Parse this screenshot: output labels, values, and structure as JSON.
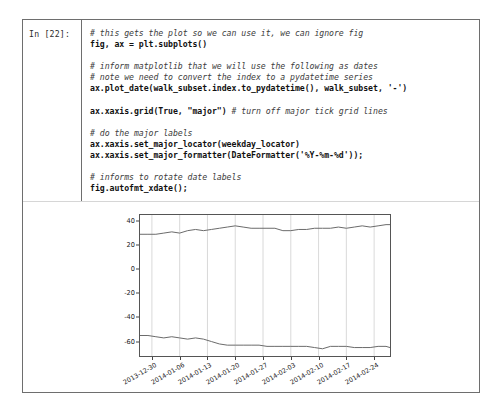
{
  "notebook": {
    "prompt_label": "In [22]:",
    "code_lines": [
      {
        "text": "# this gets the plot so we can use it, we can ignore fig",
        "style": "comment"
      },
      {
        "text": "fig, ax = plt.subplots()",
        "style": "code"
      },
      {
        "text": "",
        "style": "blank"
      },
      {
        "text": "# inform matplotlib that we will use the following as dates",
        "style": "comment"
      },
      {
        "text": "# note we need to convert the index to a pydatetime series",
        "style": "comment"
      },
      {
        "text": "ax.plot_date(walk_subset.index.to_pydatetime(), walk_subset, '-')",
        "style": "code"
      },
      {
        "text": "",
        "style": "blank"
      },
      {
        "text": "ax.xaxis.grid(True, \"major\") # turn off major tick grid lines",
        "style": "code-comment"
      },
      {
        "text": "",
        "style": "blank"
      },
      {
        "text": "# do the major labels",
        "style": "comment"
      },
      {
        "text": "ax.xaxis.set_major_locator(weekday_locator)",
        "style": "code"
      },
      {
        "text": "ax.xaxis.set_major_formatter(DateFormatter('%Y-%m-%d'));",
        "style": "code"
      },
      {
        "text": "",
        "style": "blank"
      },
      {
        "text": "# informs to rotate date labels",
        "style": "comment"
      },
      {
        "text": "fig.autofmt_xdate();",
        "style": "code"
      }
    ]
  },
  "chart_data": {
    "type": "line",
    "title": "",
    "xlabel": "",
    "ylabel": "",
    "grid": "x-major-only",
    "legend": "none",
    "line_color": "#6b6b6b",
    "ylim": [
      -72,
      45
    ],
    "yticks": [
      40,
      20,
      0,
      -20,
      -40,
      -60
    ],
    "ytick_labels": [
      "40",
      "20",
      "0",
      "-20",
      "-40",
      "-60"
    ],
    "xlim": [
      "2013-12-27",
      "2014-02-28"
    ],
    "xticks": [
      "2013-12-30",
      "2014-01-06",
      "2014-01-13",
      "2014-01-20",
      "2014-01-27",
      "2014-02-03",
      "2014-02-10",
      "2014-02-17",
      "2014-02-24"
    ],
    "series": [
      {
        "name": "walk_subset_upper",
        "x": [
          "2013-12-27",
          "2013-12-29",
          "2013-12-31",
          "2014-01-02",
          "2014-01-04",
          "2014-01-06",
          "2014-01-08",
          "2014-01-10",
          "2014-01-12",
          "2014-01-14",
          "2014-01-16",
          "2014-01-18",
          "2014-01-20",
          "2014-01-22",
          "2014-01-24",
          "2014-01-26",
          "2014-01-28",
          "2014-01-30",
          "2014-02-01",
          "2014-02-03",
          "2014-02-05",
          "2014-02-07",
          "2014-02-09",
          "2014-02-11",
          "2014-02-13",
          "2014-02-15",
          "2014-02-17",
          "2014-02-19",
          "2014-02-21",
          "2014-02-23",
          "2014-02-25",
          "2014-02-27",
          "2014-02-28"
        ],
        "values": [
          29,
          29,
          29,
          30,
          31,
          30,
          32,
          33,
          32,
          33,
          34,
          35,
          36,
          35,
          34,
          34,
          34,
          34,
          32,
          32,
          33,
          33,
          34,
          34,
          34,
          35,
          34,
          35,
          36,
          35,
          36,
          37,
          37
        ]
      },
      {
        "name": "walk_subset_lower",
        "x": [
          "2013-12-27",
          "2013-12-29",
          "2013-12-31",
          "2014-01-02",
          "2014-01-04",
          "2014-01-06",
          "2014-01-08",
          "2014-01-10",
          "2014-01-12",
          "2014-01-14",
          "2014-01-16",
          "2014-01-18",
          "2014-01-20",
          "2014-01-22",
          "2014-01-24",
          "2014-01-26",
          "2014-01-28",
          "2014-01-30",
          "2014-02-01",
          "2014-02-03",
          "2014-02-05",
          "2014-02-07",
          "2014-02-09",
          "2014-02-11",
          "2014-02-13",
          "2014-02-15",
          "2014-02-17",
          "2014-02-19",
          "2014-02-21",
          "2014-02-23",
          "2014-02-25",
          "2014-02-27",
          "2014-02-28"
        ],
        "values": [
          -55,
          -55,
          -56,
          -57,
          -56,
          -57,
          -58,
          -57,
          -58,
          -60,
          -62,
          -63,
          -63,
          -63,
          -63,
          -63,
          -64,
          -64,
          -64,
          -64,
          -64,
          -64,
          -65,
          -66,
          -64,
          -64,
          -64,
          -65,
          -65,
          -65,
          -64,
          -64,
          -65
        ]
      }
    ]
  }
}
